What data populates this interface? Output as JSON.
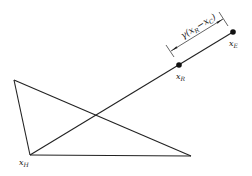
{
  "diagram": {
    "type": "geometry",
    "colors": {
      "line": "#222222",
      "background": "#ffffff"
    },
    "vertices": {
      "top_left": {
        "x": 14,
        "y": 80
      },
      "x_H": {
        "x": 30,
        "y": 155
      },
      "bottom_right": {
        "x": 191,
        "y": 156
      }
    },
    "points": {
      "x_R": {
        "x": 179,
        "y": 65,
        "marker": "filled-dot"
      },
      "x_E": {
        "x": 233,
        "y": 32,
        "marker": "filled-dot"
      }
    },
    "labels": {
      "x_H": {
        "base": "x",
        "sub": "H"
      },
      "x_R": {
        "base": "x",
        "sub": "R"
      },
      "x_E": {
        "base": "x",
        "sub": "E"
      },
      "dimension": {
        "prefix": "γ(",
        "term1_base": "x",
        "term1_sub": "R",
        "minus": "−",
        "term2_base": "x",
        "term2_sub": "C",
        "suffix": ")"
      }
    }
  }
}
